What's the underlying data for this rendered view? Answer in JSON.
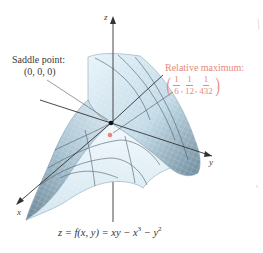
{
  "figure": {
    "type": "3d-surface-plot",
    "equation": {
      "lhs": "z = f(x, y) = xy − x",
      "x_exp": "3",
      "mid": " − y",
      "y_exp": "2"
    },
    "axes": {
      "x_label": "x",
      "y_label": "y",
      "z_label": "z"
    },
    "annotations": {
      "saddle": {
        "title": "Saddle point:",
        "coords": "(0, 0, 0)",
        "color": "#222222"
      },
      "maximum": {
        "title": "Relative maximum:",
        "coords": [
          {
            "num": "1",
            "den": "6"
          },
          {
            "num": "1",
            "den": "12"
          },
          {
            "num": "1",
            "den": "432"
          }
        ],
        "comma": ",",
        "open_paren": "(",
        "close_paren": ")",
        "color": "#e8877c"
      }
    },
    "colors": {
      "surface_light": "#e6f2f8",
      "surface_mid": "#b9d2e0",
      "surface_dark": "#7f9aab",
      "mesh": "#9fbccc",
      "contour": "#4a5a64",
      "axis": "#333333",
      "max_point": "#e8877c",
      "saddle_point": "#111111"
    }
  }
}
